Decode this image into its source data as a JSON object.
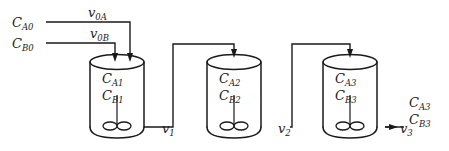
{
  "diagram": {
    "type": "process-flow-diagram",
    "stroke_color": "#1a1a1a",
    "background_color": "#ffffff"
  },
  "feeds": [
    {
      "id": "feed-a",
      "concentration_base": "C",
      "concentration_sub": "A0",
      "flow_base": "v",
      "flow_sub": "0A"
    },
    {
      "id": "feed-b",
      "concentration_base": "C",
      "concentration_sub": "B0",
      "flow_base": "v",
      "flow_sub": "0B"
    }
  ],
  "reactors": [
    {
      "id": "reactor-1",
      "species_a_base": "C",
      "species_a_sub": "A1",
      "species_b_base": "C",
      "species_b_sub": "B1"
    },
    {
      "id": "reactor-2",
      "species_a_base": "C",
      "species_a_sub": "A2",
      "species_b_base": "C",
      "species_b_sub": "B2"
    },
    {
      "id": "reactor-3",
      "species_a_base": "C",
      "species_a_sub": "A3",
      "species_b_base": "C",
      "species_b_sub": "B3"
    }
  ],
  "streams": [
    {
      "id": "stream-1",
      "flow_base": "v",
      "flow_sub": "1"
    },
    {
      "id": "stream-2",
      "flow_base": "v",
      "flow_sub": "2"
    },
    {
      "id": "stream-3",
      "flow_base": "v",
      "flow_sub": "3"
    }
  ],
  "product": {
    "species_a_base": "C",
    "species_a_sub": "A3",
    "species_b_base": "C",
    "species_b_sub": "B3"
  }
}
